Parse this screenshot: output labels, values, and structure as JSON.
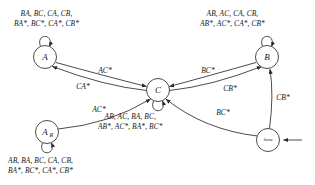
{
  "diagram": {
    "type": "state-machine",
    "title": "",
    "nodes": [
      {
        "id": "A",
        "label": "A",
        "sublabel": "",
        "cx": 45,
        "cy": 57,
        "r": 11.5,
        "self_loop": true,
        "loop_side": "top"
      },
      {
        "id": "B",
        "label": "B",
        "sublabel": "",
        "cx": 267,
        "cy": 57,
        "r": 11.5,
        "self_loop": true,
        "loop_side": "top"
      },
      {
        "id": "C",
        "label": "C",
        "sublabel": "",
        "cx": 158,
        "cy": 90,
        "r": 11.5,
        "self_loop": true,
        "loop_side": "bottom"
      },
      {
        "id": "AR",
        "label": "A",
        "sublabel": "R",
        "cx": 47,
        "cy": 132,
        "r": 11.5,
        "self_loop": true,
        "loop_side": "bottom"
      },
      {
        "id": "Same",
        "label": "Same",
        "sublabel": "",
        "cx": 268,
        "cy": 140,
        "r": 11.5,
        "self_loop": false,
        "loop_side": ""
      }
    ],
    "edges": [
      {
        "from": "A",
        "to": "C",
        "label": "AC*"
      },
      {
        "from": "C",
        "to": "A",
        "label": "CA*"
      },
      {
        "from": "B",
        "to": "C",
        "label": "BC*"
      },
      {
        "from": "C",
        "to": "B",
        "label": "CB*"
      },
      {
        "from": "AR",
        "to": "C",
        "label": "AC*"
      },
      {
        "from": "Same",
        "to": "C",
        "label": "BC*"
      },
      {
        "from": "Same",
        "to": "B",
        "label": "CB*"
      }
    ],
    "entry_arrow": {
      "into": "Same"
    },
    "self_loop_labels": {
      "A": {
        "line1": "BA, BC, CA, CB,",
        "line2": "BA*, BC*, CA*, CB*"
      },
      "B": {
        "line1": "AB, AC, CA, CB,",
        "line2": "AB*, AC*, CA*, CB*"
      },
      "C": {
        "line1": "AB, AC, BA, BC,",
        "line2": "AB*, AC*, BA*, BC*"
      },
      "AR": {
        "line1": "AB, BA, BC, CA, CB,",
        "line2": "BA*, BC*, CA*, CB*"
      }
    },
    "edge_label_positions": {
      "a_to_c": {
        "x": 105,
        "y": 71
      },
      "c_to_a": {
        "x": 83,
        "y": 87
      },
      "b_to_c": {
        "x": 208,
        "y": 71
      },
      "c_to_b": {
        "x": 230,
        "y": 89
      },
      "ar_to_c": {
        "x": 99,
        "y": 110
      },
      "same_to_c": {
        "x": 223,
        "y": 113
      },
      "same_to_b": {
        "x": 283,
        "y": 98
      }
    },
    "colors": {
      "stroke": "#2a2a2a",
      "text": "#1a1a1a",
      "background": "#ffffff"
    }
  }
}
